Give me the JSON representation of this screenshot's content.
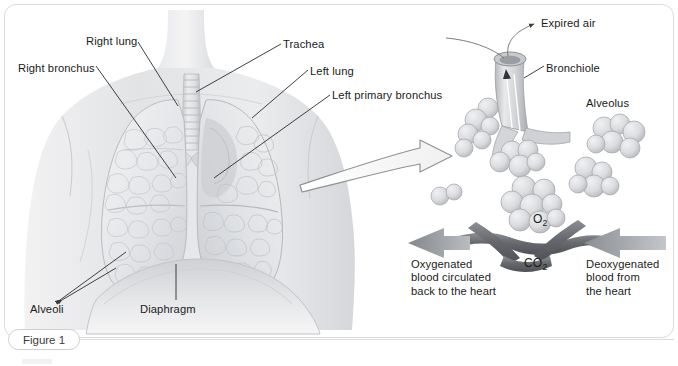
{
  "figure": {
    "caption_badge": "Figure 1"
  },
  "left_panel": {
    "name": "thorax-lungs-illustration",
    "labels": [
      {
        "id": "right-bronchus",
        "text": "Right bronchus",
        "x": 18,
        "y": 62
      },
      {
        "id": "right-lung",
        "text": "Right lung",
        "x": 86,
        "y": 35
      },
      {
        "id": "trachea",
        "text": "Trachea",
        "x": 283,
        "y": 38
      },
      {
        "id": "left-lung",
        "text": "Left lung",
        "x": 310,
        "y": 65
      },
      {
        "id": "left-primary-bronchus",
        "text": "Left primary bronchus",
        "x": 332,
        "y": 89
      },
      {
        "id": "alveoli",
        "text": "Alveoli",
        "x": 30,
        "y": 303
      },
      {
        "id": "diaphragm",
        "text": "Diaphragm",
        "x": 140,
        "y": 303
      }
    ]
  },
  "right_panel": {
    "name": "alveolus-gas-exchange-detail",
    "labels": [
      {
        "id": "expired-air",
        "text": "Expired air",
        "x": 541,
        "y": 17
      },
      {
        "id": "bronchiole",
        "text": "Bronchiole",
        "x": 546,
        "y": 62
      },
      {
        "id": "alveolus",
        "text": "Alveolus",
        "x": 586,
        "y": 97
      }
    ],
    "gas_labels": [
      {
        "id": "oxygen",
        "text": "O",
        "subscript": "2",
        "x": 533,
        "y": 212
      },
      {
        "id": "carbon-dioxide",
        "text": "CO",
        "subscript": "2",
        "x": 524,
        "y": 256
      }
    ],
    "flow_captions": [
      {
        "id": "oxygenated-blood",
        "text": "Oxygenated\nblood circulated\nback to the heart",
        "x": 411,
        "y": 258
      },
      {
        "id": "deoxygenated-blood",
        "text": "Deoxygenated\nblood from\nthe heart",
        "x": 586,
        "y": 258
      }
    ]
  },
  "colors": {
    "frame": "#dcdcdc",
    "text": "#1b1b1b",
    "leader_line": "#2b2b2b",
    "vessel": "#6f7276",
    "arrow_fill": "#9a9da1",
    "lung_tissue": "#e9eaec",
    "skin": "#e3e4e6"
  }
}
